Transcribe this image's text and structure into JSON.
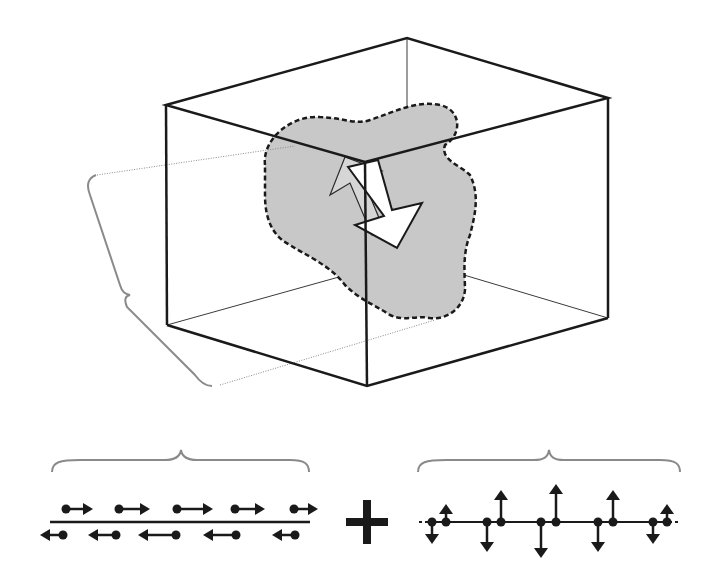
{
  "diagram": {
    "colors": {
      "edge": "#1a1a1a",
      "hidden_edge": "#3a3a3a",
      "region_fill": "#c8c8c8",
      "region_outline": "#1a1a1a",
      "brace": "#8a8a8a",
      "dotted_guide": "#8a8a8a",
      "arrow_fill": "#ffffff",
      "spin_arrow": "#1a1a1a"
    },
    "box": {
      "front_top": [
        365,
        162
      ],
      "left_top": [
        166,
        105
      ],
      "back_top": [
        407,
        38
      ],
      "right_top": [
        608,
        98
      ],
      "front_bottom": [
        367,
        386
      ],
      "left_bottom": [
        167,
        325
      ],
      "back_bottom": [
        407,
        258
      ],
      "right_bottom": [
        608,
        318
      ]
    },
    "longitudinal": {
      "upper_arrows": [
        [
          66,
          509,
          93
        ],
        [
          119,
          509,
          150
        ],
        [
          177,
          509,
          213
        ],
        [
          235,
          509,
          265
        ],
        [
          294,
          509,
          318
        ]
      ],
      "lower_arrows": [
        [
          63,
          535,
          40
        ],
        [
          116,
          535,
          88
        ],
        [
          176,
          535,
          138
        ],
        [
          236,
          535,
          203
        ],
        [
          295,
          535,
          272
        ]
      ],
      "baseline": [
        50,
        522,
        310,
        522
      ],
      "brace": [
        52,
        470,
        309,
        470
      ]
    },
    "plus_sign": {
      "cx": 367,
      "cy": 522
    },
    "transverse": {
      "baseline_y": 522,
      "x_range": [
        418,
        680
      ],
      "brace": [
        418,
        470,
        680,
        470
      ],
      "spins": [
        {
          "x": 432,
          "dir": "down",
          "len": 22
        },
        {
          "x": 446,
          "dir": "up",
          "len": 18
        },
        {
          "x": 487,
          "dir": "down",
          "len": 30
        },
        {
          "x": 501,
          "dir": "up",
          "len": 32
        },
        {
          "x": 541,
          "dir": "down",
          "len": 36
        },
        {
          "x": 556,
          "dir": "up",
          "len": 38
        },
        {
          "x": 598,
          "dir": "down",
          "len": 30
        },
        {
          "x": 613,
          "dir": "up",
          "len": 32
        },
        {
          "x": 653,
          "dir": "down",
          "len": 22
        },
        {
          "x": 667,
          "dir": "up",
          "len": 18
        }
      ]
    }
  }
}
